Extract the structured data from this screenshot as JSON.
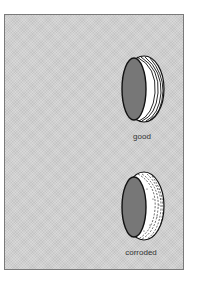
{
  "figure": {
    "items": [
      {
        "label": "good",
        "condition": "good"
      },
      {
        "label": "corroded",
        "condition": "corroded"
      }
    ],
    "colors": {
      "panel_background": "#cfcfcf",
      "panel_border": "#7a7a7a",
      "ring_inner": "#777777",
      "ring_outer": "#ffffff",
      "outline": "#111111"
    }
  }
}
